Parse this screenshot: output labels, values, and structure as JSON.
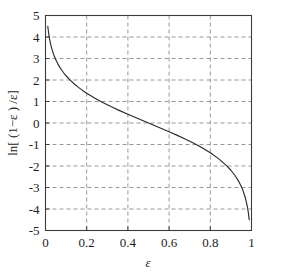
{
  "chart_data": {
    "type": "line",
    "title": "",
    "subtitle": "",
    "xlabel": "ε",
    "ylabel": "ln[ (1−ε ) /ε]",
    "xlim": [
      0,
      1
    ],
    "ylim": [
      -5,
      5
    ],
    "xticks": [
      0,
      0.2,
      0.4,
      0.6,
      0.8,
      1
    ],
    "xtick_labels": [
      "0",
      "0.2",
      "0.4",
      "0.6",
      "0.8",
      "1"
    ],
    "yticks": [
      5,
      4,
      3,
      2,
      1,
      0,
      -1,
      -2,
      -3,
      -4,
      -5
    ],
    "ytick_labels": [
      "5",
      "4",
      "3",
      "2",
      "1",
      "0",
      "-1",
      "-2",
      "-3",
      "-4",
      "-5"
    ],
    "grid": true,
    "grid_style": "dashed",
    "grid_color": "#8c8c8c",
    "legend": null,
    "legend_position": "none",
    "annotations": [],
    "curve_color": "#2b2b2b",
    "axis_color": "#3c3c3c",
    "background_color": "#ffffff",
    "series": [
      {
        "name": "ln[(1-ε)/ε]",
        "formula": "y = ln((1 - x) / x)",
        "x": [
          0.011,
          0.015,
          0.02,
          0.026,
          0.033,
          0.04,
          0.05,
          0.06,
          0.07,
          0.08,
          0.09,
          0.1,
          0.12,
          0.14,
          0.16,
          0.18,
          0.2,
          0.24,
          0.28,
          0.32,
          0.36,
          0.4,
          0.44,
          0.48,
          0.5,
          0.52,
          0.56,
          0.6,
          0.64,
          0.68,
          0.72,
          0.76,
          0.8,
          0.84,
          0.88,
          0.9,
          0.92,
          0.94,
          0.95,
          0.96,
          0.97,
          0.98,
          0.985,
          0.989
        ],
        "y": [
          4.498,
          4.1897,
          3.8918,
          3.62,
          3.3793,
          3.1781,
          2.9444,
          2.7515,
          2.5867,
          2.4423,
          2.3136,
          2.1972,
          1.9924,
          1.8153,
          1.6582,
          1.5163,
          1.3863,
          1.1527,
          0.9445,
          0.7538,
          0.5754,
          0.4055,
          0.2412,
          0.08,
          0.0,
          -0.08,
          -0.2412,
          -0.4055,
          -0.5754,
          -0.7538,
          -0.9445,
          -1.1527,
          -1.3863,
          -1.6582,
          -1.9924,
          -2.1972,
          -2.4423,
          -2.7515,
          -2.9444,
          -3.1781,
          -3.4761,
          -3.8918,
          -4.1897,
          -4.498
        ]
      }
    ],
    "reference_points": [
      {
        "x": 0.0,
        "y": 4.5,
        "note": "curve left start near top"
      },
      {
        "x": 0.1,
        "y": 2.2,
        "note": "steep descent region"
      },
      {
        "x": 0.2,
        "y": 1.386
      },
      {
        "x": 0.5,
        "y": 0.0,
        "note": "zero crossing at midpoint"
      },
      {
        "x": 0.8,
        "y": -1.386
      },
      {
        "x": 1.0,
        "y": -4.5,
        "note": "curve right end near bottom"
      }
    ]
  },
  "axes": {
    "x_title": "ε",
    "y_title_parts": {
      "ln": "ln[ (1",
      "minus": "−",
      "eps1": "ε",
      "close": " ) /",
      "eps2": "ε",
      "bracket": "]"
    },
    "y_title_full": "ln[ (1−ε ) /ε]"
  }
}
